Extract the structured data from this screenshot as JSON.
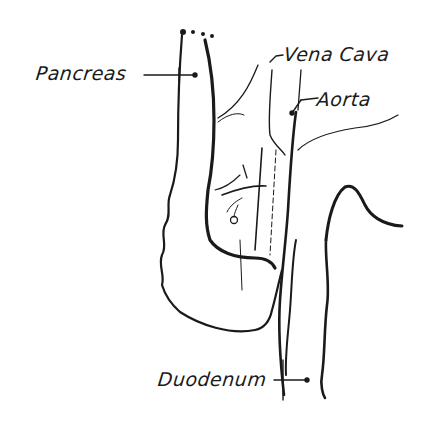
{
  "diagram": {
    "type": "anatomical line drawing",
    "ink_color": "#1a1a1a",
    "background": "#ffffff",
    "labels": [
      {
        "id": "pancreas",
        "text": "Pancreas"
      },
      {
        "id": "vena_cava",
        "text": "Vena Cava"
      },
      {
        "id": "aorta",
        "text": "Aorta"
      },
      {
        "id": "duodenum",
        "text": "Duodenum"
      }
    ]
  }
}
